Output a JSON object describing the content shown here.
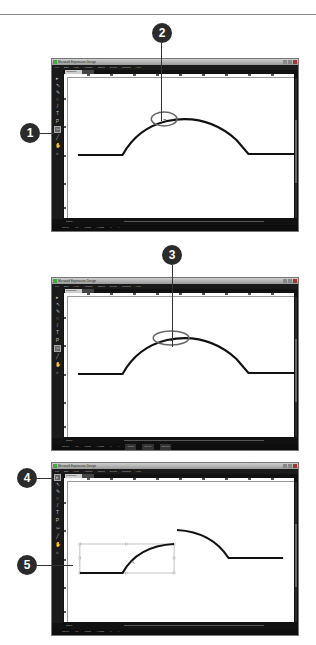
{
  "app": {
    "title": "Microsoft Expression Design",
    "menu": [
      "File",
      "Edit",
      "View",
      "Arrange",
      "Object",
      "Select",
      "Window",
      "Help"
    ],
    "document_tab": "Untitled1*",
    "window_buttons": [
      "minimize",
      "maximize",
      "close"
    ]
  },
  "screens": [
    {
      "zoom_value": "100%",
      "status": [
        "Stroke",
        "Fill",
        "Width",
        "Height",
        "X",
        "Y"
      ],
      "callouts": [
        {
          "number": "1",
          "target": "B-Spline/Pen tool in toolbox"
        },
        {
          "number": "2",
          "target": "anchor point at top of curve"
        }
      ]
    },
    {
      "zoom_value": "100%",
      "status": [
        "Stroke",
        "Fill",
        "Width",
        "Height",
        "X",
        "Y"
      ],
      "status_buttons": [
        "Image",
        "Stroke",
        "Effects"
      ],
      "callouts": [
        {
          "number": "3",
          "target": "clicked anchor point (scissors cut)"
        }
      ]
    },
    {
      "zoom_value": "100%",
      "status": [
        "Stroke",
        "Fill",
        "Width",
        "Height",
        "X",
        "Y"
      ],
      "callouts": [
        {
          "number": "4",
          "target": "Selection tool"
        },
        {
          "number": "5",
          "target": "selected split path segment"
        }
      ]
    }
  ],
  "colors": {
    "ui_dark": "#111111",
    "callout": "#2b2b2b",
    "highlight_ellipse": "#666666",
    "path": "#111111"
  }
}
